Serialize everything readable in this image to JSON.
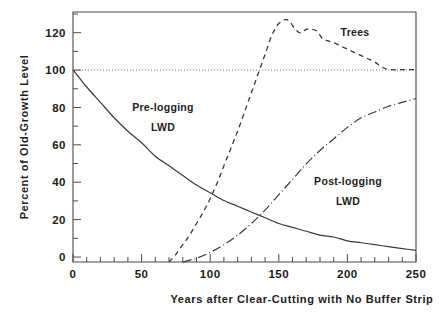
{
  "chart_data": {
    "type": "line",
    "title": "",
    "subtitle": "",
    "xlabel": "Years after Clear-Cutting with No Buffer Strip",
    "ylabel": "Percent of Old-Growth Level",
    "xlim": [
      0,
      250
    ],
    "ylim": [
      0,
      130
    ],
    "x_ticks_major": [
      0,
      50,
      100,
      150,
      200,
      250
    ],
    "x_tick_labels": [
      "0",
      "50",
      "100",
      "150",
      "200",
      "250"
    ],
    "x_tick_minor_step": 10,
    "y_ticks_major": [
      0,
      20,
      40,
      60,
      80,
      100,
      120
    ],
    "y_tick_labels": [
      "0",
      "20",
      "40",
      "60",
      "80",
      "100",
      "120"
    ],
    "y_tick_minor_step": 10,
    "grid": false,
    "legend_position": "inline-annotations",
    "reference_lines": [
      {
        "name": "old-growth-100-percent",
        "axis": "y",
        "value": 100,
        "style": "dotted"
      }
    ],
    "annotations": [
      {
        "name": "pre-logging-lwd-label",
        "text_line1": "Pre-logging",
        "text_line2": "LWD",
        "x": 40,
        "y": 82
      },
      {
        "name": "post-logging-lwd-label",
        "text_line1": "Post-logging",
        "text_line2": "LWD",
        "x": 168,
        "y": 48
      },
      {
        "name": "trees-label",
        "text": "Trees",
        "x": 210,
        "y": 121
      }
    ],
    "series": [
      {
        "name": "Pre-logging LWD",
        "style": "solid",
        "x": [
          0,
          10,
          20,
          30,
          40,
          50,
          60,
          70,
          80,
          90,
          100,
          110,
          120,
          130,
          140,
          150,
          160,
          170,
          180,
          190,
          200,
          210,
          220,
          230,
          240,
          250
        ],
        "values": [
          100,
          91,
          83,
          75,
          68,
          62,
          55,
          50,
          45,
          40,
          36,
          32,
          29,
          26,
          23,
          20,
          18,
          16,
          14,
          13,
          11,
          10,
          9,
          8,
          7,
          6
        ]
      },
      {
        "name": "Trees",
        "style": "dashed",
        "x": [
          70,
          75,
          80,
          85,
          90,
          95,
          100,
          105,
          110,
          115,
          120,
          125,
          130,
          135,
          140,
          145,
          150,
          155,
          158,
          162,
          166,
          170,
          174,
          178,
          182,
          186,
          190,
          196,
          202,
          208,
          214,
          220,
          226,
          232,
          238,
          244,
          250
        ],
        "values": [
          0,
          4,
          9,
          14,
          20,
          26,
          33,
          41,
          50,
          59,
          68,
          78,
          88,
          98,
          108,
          118,
          124,
          126,
          125,
          121,
          119,
          121,
          121,
          120,
          116,
          115,
          114,
          112,
          110,
          108,
          106,
          104,
          101,
          100,
          100,
          100,
          100
        ]
      },
      {
        "name": "Post-logging LWD",
        "style": "dash-dot",
        "x": [
          80,
          90,
          100,
          110,
          120,
          130,
          140,
          150,
          160,
          170,
          180,
          190,
          200,
          210,
          220,
          230,
          240,
          250
        ],
        "values": [
          0,
          2,
          5,
          9,
          14,
          20,
          27,
          35,
          43,
          51,
          58,
          64,
          70,
          75,
          78,
          81,
          83,
          85
        ]
      }
    ]
  },
  "axes": {
    "y_title": "Percent of Old-Growth Level",
    "x_title": "Years after Clear-Cutting with No Buffer Strip"
  },
  "labels": {
    "pre_logging_line1": "Pre-logging",
    "pre_logging_line2": "LWD",
    "post_logging_line1": "Post-logging",
    "post_logging_line2": "LWD",
    "trees": "Trees"
  },
  "ticks": {
    "y": [
      "120",
      "100",
      "80",
      "60",
      "40",
      "20",
      "0"
    ],
    "x": [
      "0",
      "50",
      "100",
      "150",
      "200",
      "250"
    ]
  },
  "colors": {
    "axis": "#4a4a4a",
    "curve": "#3a3a3a",
    "reference": "#7a7a7a",
    "text": "#1a1a1a",
    "background": "#ffffff"
  }
}
